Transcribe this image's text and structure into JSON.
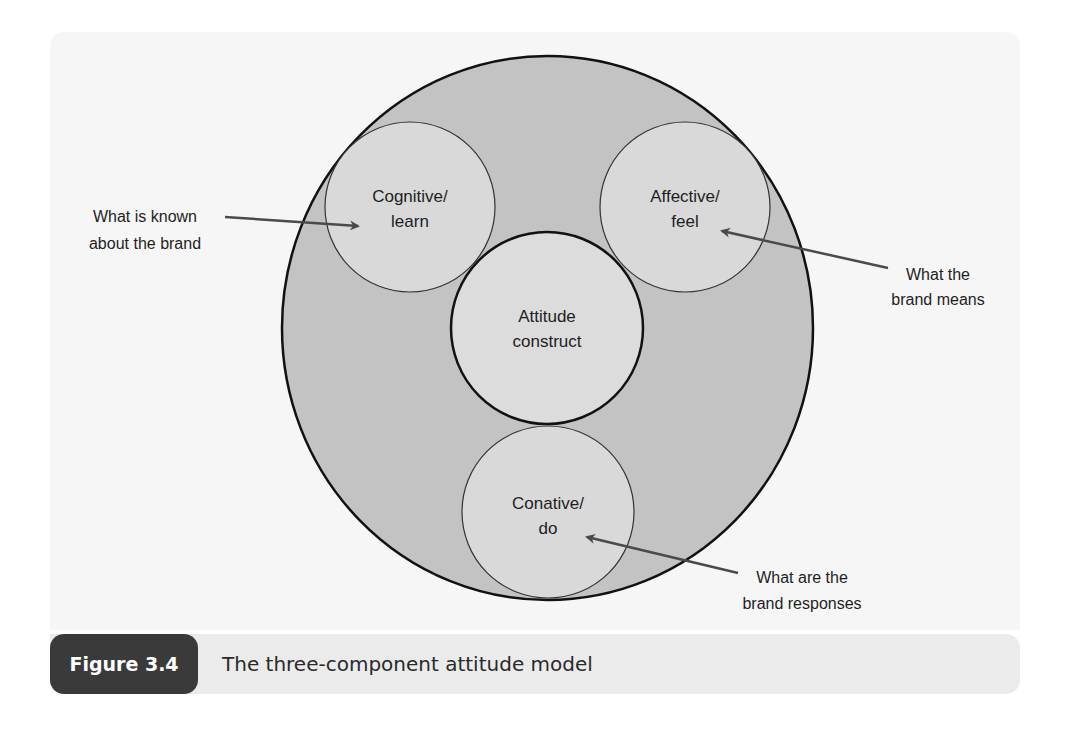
{
  "figure": {
    "number_label": "Figure 3.4",
    "caption": "The three-component attitude model"
  },
  "colors": {
    "panel_bg": "#f6f6f6",
    "outer_circle_fill": "#c3c3c3",
    "inner_circle_fill": "#d9d9d9",
    "stroke": "#111111",
    "arrow": "#4a4a4a",
    "caption_bar_bg": "#ebebeb",
    "caption_badge_bg": "#3a3a3a"
  },
  "diagram": {
    "center": {
      "line1": "Attitude",
      "line2": "construct"
    },
    "components": [
      {
        "id": "cognitive",
        "line1": "Cognitive/",
        "line2": "learn"
      },
      {
        "id": "affective",
        "line1": "Affective/",
        "line2": "feel"
      },
      {
        "id": "conative",
        "line1": "Conative/",
        "line2": "do"
      }
    ],
    "annotations": [
      {
        "target": "cognitive",
        "line1": "What is known",
        "line2": "about the brand"
      },
      {
        "target": "affective",
        "line1": "What the",
        "line2": "brand means"
      },
      {
        "target": "conative",
        "line1": "What are the",
        "line2": "brand responses"
      }
    ]
  }
}
